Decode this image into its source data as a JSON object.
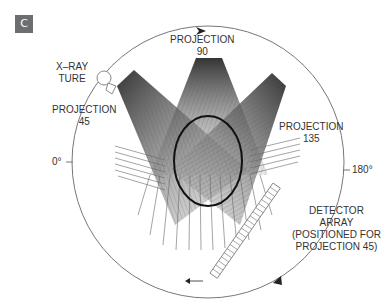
{
  "panel_label": "C",
  "labels": {
    "xray_tube": [
      "X–RAY",
      "TURE"
    ],
    "projection_90": [
      "PROJECTION",
      "90"
    ],
    "projection_45": [
      "PROJECTION",
      "45"
    ],
    "projection_135": [
      "PROJECTION",
      "135"
    ],
    "angle_0": "0°",
    "angle_180": "180°",
    "detector": [
      "DETECTOR",
      "ARRAY",
      "(POSITIONED FOR",
      "PROJECTION 45)"
    ]
  },
  "colors": {
    "circle": "#777777",
    "beam_dark": "#333333",
    "object": "#111111",
    "badge": "#6d6e70"
  }
}
